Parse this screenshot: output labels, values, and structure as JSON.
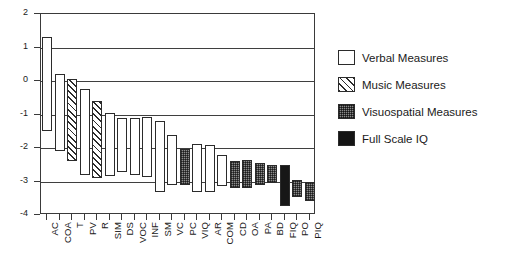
{
  "chart_data": {
    "type": "bar",
    "subtype": "floating-range-bars",
    "title": "",
    "xlabel": "",
    "ylabel": "",
    "ylim": [
      -4,
      2
    ],
    "yticks": [
      "2",
      "1",
      "0",
      "-1",
      "-2",
      "-3",
      "-4"
    ],
    "ytick_values": [
      2,
      1,
      0,
      -1,
      -2,
      -3,
      -4
    ],
    "grid": "horizontal",
    "legend_position": "right",
    "categories": [
      "AC",
      "COA",
      "T",
      "PV",
      "R",
      "SIM",
      "DS",
      "VOC",
      "INF",
      "SM",
      "VC",
      "PC",
      "VIQ",
      "AR",
      "COM",
      "CD",
      "OA",
      "PA",
      "BD",
      "FIQ",
      "PO",
      "PIQ"
    ],
    "series": [
      {
        "name": "Verbal Measures",
        "group": "verbal",
        "fill": "#ffffff",
        "points": [
          {
            "category": "AC",
            "high": 1.3,
            "low": -1.5
          },
          {
            "category": "COA",
            "high": 0.2,
            "low": -2.1
          },
          {
            "category": "PV",
            "high": -0.25,
            "low": -2.8
          },
          {
            "category": "SIM",
            "high": -0.97,
            "low": -2.85
          },
          {
            "category": "DS",
            "high": -1.1,
            "low": -2.72
          },
          {
            "category": "VOC",
            "high": -1.1,
            "low": -2.8
          },
          {
            "category": "INF",
            "high": -1.07,
            "low": -2.88
          },
          {
            "category": "SM",
            "high": -1.2,
            "low": -3.3
          },
          {
            "category": "VC",
            "high": -1.62,
            "low": -3.1
          },
          {
            "category": "VIQ",
            "high": -1.88,
            "low": -3.32
          },
          {
            "category": "AR",
            "high": -1.92,
            "low": -3.3
          },
          {
            "category": "COM",
            "high": -2.22,
            "low": -3.12
          }
        ]
      },
      {
        "name": "Music Measures",
        "group": "music",
        "fill": "diagonal-hatch",
        "points": [
          {
            "category": "T",
            "high": 0.05,
            "low": -2.4
          },
          {
            "category": "R",
            "high": -0.6,
            "low": -2.9
          }
        ]
      },
      {
        "name": "Visuospatial Measures",
        "group": "visuospatial",
        "fill": "#8d8d8d",
        "points": [
          {
            "category": "PC",
            "high": -2.02,
            "low": -3.1
          },
          {
            "category": "CD",
            "high": -2.38,
            "low": -3.18
          },
          {
            "category": "OA",
            "high": -2.35,
            "low": -3.2
          },
          {
            "category": "PA",
            "high": -2.45,
            "low": -3.1
          },
          {
            "category": "BD",
            "high": -2.52,
            "low": -3.05
          },
          {
            "category": "PO",
            "high": -2.95,
            "low": -3.45
          },
          {
            "category": "PIQ",
            "high": -3.0,
            "low": -3.58
          }
        ]
      },
      {
        "name": "Full Scale IQ",
        "group": "fsiq",
        "fill": "#171717",
        "points": [
          {
            "category": "FIQ",
            "high": -2.5,
            "low": -3.72
          }
        ]
      }
    ]
  },
  "legend": {
    "items": [
      {
        "label": "Verbal Measures",
        "group": "verbal"
      },
      {
        "label": "Music Measures",
        "group": "music"
      },
      {
        "label": "Visuospatial  Measures",
        "group": "visuospatial"
      },
      {
        "label": "Full Scale IQ",
        "group": "fsiq"
      }
    ]
  }
}
